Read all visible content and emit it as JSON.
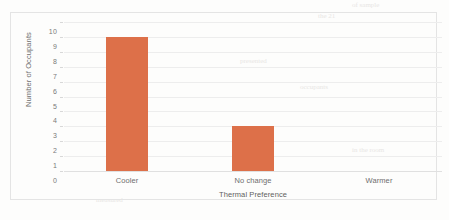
{
  "chart_data": {
    "type": "bar",
    "title": "",
    "xlabel": "Thermal Preference",
    "ylabel": "Number of Occupants",
    "categories": [
      "Cooler",
      "No change",
      "Warmer"
    ],
    "values": [
      9,
      3,
      0
    ],
    "ylim": [
      0,
      10
    ],
    "ytick_labels": [
      "10",
      "9",
      "8",
      "7",
      "6",
      "5",
      "4",
      "3",
      "2",
      "1",
      "0"
    ],
    "ytick_values": [
      10,
      9,
      8,
      7,
      6,
      5,
      4,
      3,
      2,
      1,
      0
    ],
    "grid": true,
    "legend": false,
    "bar_color": "#dd7049",
    "gridline_color": "#ededed",
    "axis_text_color": "#6e6e6e"
  },
  "artifacts": {
    "ghost_marks": [
      {
        "text": "of sample",
        "x": 352,
        "y": 1,
        "size": 7
      },
      {
        "text": "the 21",
        "x": 318,
        "y": 12,
        "size": 7
      },
      {
        "text": "presented",
        "x": 240,
        "y": 57,
        "size": 7
      },
      {
        "text": "occupants",
        "x": 300,
        "y": 83,
        "size": 7
      },
      {
        "text": "in the room",
        "x": 352,
        "y": 146,
        "size": 7
      },
      {
        "text": "measured",
        "x": 96,
        "y": 196,
        "size": 7
      }
    ]
  }
}
